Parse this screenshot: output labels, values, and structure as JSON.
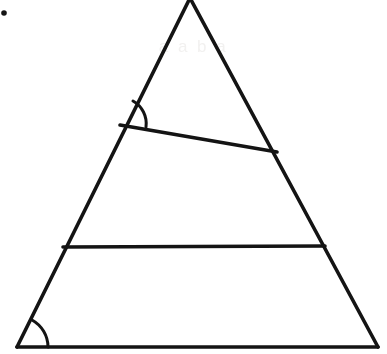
{
  "figure": {
    "background_color": "#ffffff",
    "stroke_color": "#141414",
    "stroke_width": 3.6,
    "width": 387,
    "height": 354,
    "ghost_text": "a  a  b  a",
    "ghost_text_color": "#f2f1f0"
  },
  "geometry": {
    "triangle": {
      "name": "main-triangle",
      "apex": {
        "x": 190,
        "y": -2
      },
      "bottom_left": {
        "x": 17,
        "y": 347
      },
      "bottom_right": {
        "x": 378,
        "y": 347
      }
    },
    "transversal_upper": {
      "name": "upper-transversal-line",
      "start": {
        "x": 120,
        "y": 125
      },
      "end": {
        "x": 277,
        "y": 152
      }
    },
    "transversal_lower": {
      "name": "lower-horizontal-line",
      "start": {
        "x": 63,
        "y": 247
      },
      "end": {
        "x": 325,
        "y": 246
      }
    },
    "angle_marks": [
      {
        "name": "angle-arc-upper-left",
        "vertex": {
          "x": 120,
          "y": 125
        },
        "radius": 26,
        "path": "M 133 101 A 26 26 0 0 1 146 127"
      },
      {
        "name": "angle-arc-bottom-left",
        "vertex": {
          "x": 17,
          "y": 347
        },
        "radius": 31,
        "path": "M 32 320 A 31 31 0 0 1 48 347"
      }
    ],
    "speck": {
      "name": "scan-speck",
      "x": 4,
      "y": 13,
      "radius": 2.8
    }
  },
  "chart_data": {
    "type": "diagram",
    "elements": [
      {
        "label": "left side",
        "from": "apex",
        "to": "bottom-left"
      },
      {
        "label": "right side",
        "from": "apex",
        "to": "bottom-right"
      },
      {
        "label": "base",
        "from": "bottom-left",
        "to": "bottom-right"
      },
      {
        "label": "upper transversal",
        "from": "left side",
        "to": "right side"
      },
      {
        "label": "lower transversal",
        "from": "left side",
        "to": "right side"
      }
    ],
    "marked_angles": 2
  }
}
